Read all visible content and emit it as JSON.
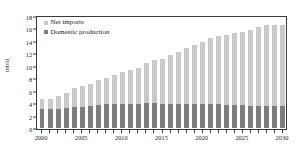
{
  "chart_data": {
    "type": "bar",
    "stacked": true,
    "title": "",
    "xlabel": "",
    "ylabel": "mb/d",
    "ylim": [
      0,
      18
    ],
    "ytick_values": [
      0,
      2,
      4,
      6,
      8,
      10,
      12,
      14,
      16,
      18
    ],
    "ytick_labels": [
      "0",
      "2",
      "4",
      "6",
      "8",
      "10",
      "12",
      "14",
      "16",
      "18"
    ],
    "xlim_years": [
      2000,
      2030
    ],
    "xtick_labels": [
      "2000",
      "2005",
      "2010",
      "2015",
      "2020",
      "2025",
      "2030"
    ],
    "xtick_years": [
      2000,
      2005,
      2010,
      2015,
      2020,
      2025,
      2030
    ],
    "grid": false,
    "legend_position": "top-left",
    "categories": [
      "2000",
      "2001",
      "2002",
      "2003",
      "2004",
      "2005",
      "2006",
      "2007",
      "2008",
      "2009",
      "2010",
      "2011",
      "2012",
      "2013",
      "2014",
      "2015",
      "2016",
      "2017",
      "2018",
      "2019",
      "2020",
      "2021",
      "2022",
      "2023",
      "2024",
      "2025",
      "2026",
      "2027",
      "2028",
      "2029",
      "2030"
    ],
    "series": [
      {
        "name": "Domestic production",
        "color": "#7d7d7d",
        "values": [
          3.1,
          3.1,
          3.1,
          3.2,
          3.3,
          3.4,
          3.6,
          3.7,
          3.8,
          3.8,
          3.8,
          3.9,
          3.9,
          4.0,
          4.0,
          3.9,
          3.9,
          3.9,
          3.9,
          3.9,
          3.8,
          3.8,
          3.8,
          3.7,
          3.7,
          3.7,
          3.6,
          3.6,
          3.5,
          3.5,
          3.5
        ]
      },
      {
        "name": "Net imports",
        "color": "#c9c9c9",
        "values": [
          1.6,
          1.6,
          2.0,
          2.4,
          3.1,
          3.3,
          3.5,
          4.0,
          4.3,
          4.8,
          5.2,
          5.4,
          5.8,
          6.5,
          6.9,
          7.2,
          7.8,
          8.3,
          9.0,
          9.4,
          10.0,
          10.6,
          11.0,
          11.2,
          11.6,
          11.8,
          12.2,
          12.6,
          13.0,
          13.1,
          13.1
        ]
      }
    ],
    "totals": [
      4.7,
      4.7,
      5.1,
      5.6,
      6.4,
      6.7,
      7.1,
      7.7,
      8.1,
      8.6,
      9.0,
      9.3,
      9.7,
      10.5,
      10.9,
      11.1,
      11.7,
      12.2,
      12.9,
      13.3,
      13.8,
      14.4,
      14.8,
      14.9,
      15.3,
      15.5,
      15.8,
      16.2,
      16.5,
      16.6,
      16.6
    ]
  },
  "legend": {
    "entries": [
      {
        "label": "Net imports",
        "color": "#c9c9c9"
      },
      {
        "label": "Domestic production",
        "color": "#7d7d7d"
      }
    ]
  },
  "axes": {
    "y_title": "mb/d"
  }
}
